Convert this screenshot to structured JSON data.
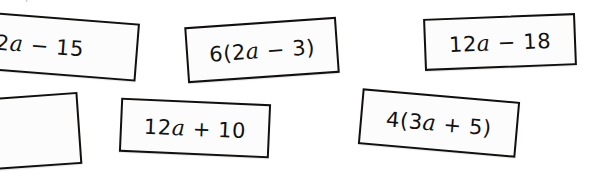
{
  "page": {
    "background_color": "#ffffff",
    "width": 600,
    "height": 178
  },
  "header": {
    "clipped_text": "Expression cards",
    "color": "#9a9a9a",
    "note": "top line is cut off by the top edge of the screenshot"
  },
  "cards": [
    {
      "id": "card-1",
      "expression": "2a − 15",
      "full_expression_guess": "2a − 15",
      "clipped": "left",
      "rotation_deg": 4.5,
      "border_color": "#12100f",
      "fill_color": "#fcfcfc"
    },
    {
      "id": "card-2",
      "expression": "6(2a − 3)",
      "clipped": "none",
      "rotation_deg": -4,
      "border_color": "#12100f",
      "fill_color": "#fcfcfc"
    },
    {
      "id": "card-3",
      "expression": "12a − 18",
      "clipped": "none",
      "rotation_deg": -2.2,
      "border_color": "#12100f",
      "fill_color": "#fcfcfc"
    },
    {
      "id": "card-4",
      "expression": "",
      "clipped": "left-and-bottom",
      "rotation_deg": -4,
      "border_color": "#12100f",
      "fill_color": "#fcfcfc"
    },
    {
      "id": "card-5",
      "expression": "12a + 10",
      "clipped": "none",
      "rotation_deg": 2.5,
      "border_color": "#12100f",
      "fill_color": "#fcfcfc"
    },
    {
      "id": "card-6",
      "expression": "4(3a + 5)",
      "clipped": "none",
      "rotation_deg": 5,
      "border_color": "#12100f",
      "fill_color": "#fcfcfc"
    }
  ]
}
